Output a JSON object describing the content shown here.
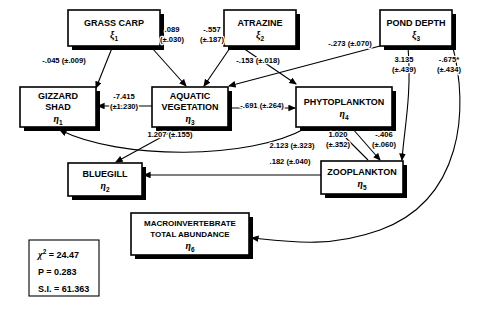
{
  "figure": {
    "type": "path-diagram",
    "background_color": "#ffffff",
    "line_color": "#000000"
  },
  "nodes": [
    {
      "id": "grass-carp",
      "lines": [
        "GRASS CARP"
      ],
      "symbol": "ξ",
      "subscript": "1",
      "x": 68,
      "y": 10,
      "w": 92,
      "h": 36
    },
    {
      "id": "atrazine",
      "lines": [
        "ATRAZINE"
      ],
      "symbol": "ξ",
      "subscript": "2",
      "x": 224,
      "y": 10,
      "w": 72,
      "h": 36
    },
    {
      "id": "pond-depth",
      "lines": [
        "POND DEPTH"
      ],
      "symbol": "ξ",
      "subscript": "3",
      "x": 380,
      "y": 10,
      "w": 72,
      "h": 36
    },
    {
      "id": "gizzard-shad",
      "lines": [
        "GIZZARD",
        "SHAD"
      ],
      "symbol": "η",
      "subscript": "1",
      "x": 20,
      "y": 87,
      "w": 76,
      "h": 40
    },
    {
      "id": "aquatic-vegetation",
      "lines": [
        "AQUATIC",
        "VEGETATION"
      ],
      "symbol": "η",
      "subscript": "3",
      "x": 152,
      "y": 87,
      "w": 76,
      "h": 40
    },
    {
      "id": "phytoplankton",
      "lines": [
        "PHYTOPLANKTON"
      ],
      "symbol": "η",
      "subscript": "4",
      "x": 296,
      "y": 87,
      "w": 96,
      "h": 40
    },
    {
      "id": "bluegill",
      "lines": [
        "BLUEGILL"
      ],
      "symbol": "η",
      "subscript": "2",
      "x": 68,
      "y": 163,
      "w": 74,
      "h": 33
    },
    {
      "id": "zooplankton",
      "lines": [
        "ZOOPLANKTON"
      ],
      "symbol": "η",
      "subscript": "5",
      "x": 321,
      "y": 161,
      "w": 82,
      "h": 33
    },
    {
      "id": "macroinvertebrate",
      "lines": [
        "MACROINVERTEBRATE",
        "TOTAL ABUNDANCE"
      ],
      "symbol": "η",
      "subscript": "6",
      "x": 131,
      "y": 213,
      "w": 118,
      "h": 42
    }
  ],
  "paths": [
    {
      "id": "grass-carp-to-gizzard-shad",
      "from": "grass-carp",
      "to": "gizzard-shad",
      "coefficient": "-.045",
      "error": "(±.009)",
      "label": "-.045 (±.009)",
      "label_x": 64,
      "label_y": 63,
      "d": "M 112 48 L 96 88"
    },
    {
      "id": "grass-carp-to-aquatic-vegetation",
      "from": "grass-carp",
      "to": "aquatic-vegetation",
      "coefficient": ".089",
      "error": "(±.030)",
      "label": ".089 (±.030)",
      "label_x": 172,
      "label_y": 32,
      "label_line1": ".089",
      "label_line2": "(±.030)",
      "d": "M 152 48 L 186 86"
    },
    {
      "id": "atrazine-to-aquatic-vegetation",
      "from": "atrazine",
      "to": "aquatic-vegetation",
      "coefficient": "-.557",
      "error": "(±.187)",
      "label": "-.557 (±.187)",
      "label_x": 212,
      "label_y": 32,
      "label_line1": "-.557",
      "label_line2": "(±.187)",
      "d": "M 230 48 L 204 86"
    },
    {
      "id": "atrazine-to-phytoplankton",
      "from": "atrazine",
      "to": "phytoplankton",
      "coefficient": "-.153",
      "error": "(±.018)",
      "label": "-.153 (±.018)",
      "label_x": 258,
      "label_y": 63,
      "d": "M 243 48 L 296 84"
    },
    {
      "id": "pond-depth-to-aquatic-vegetation",
      "from": "pond-depth",
      "to": "aquatic-vegetation",
      "coefficient": "-.273",
      "error": "(±.070)",
      "label": "-.273 (±.070)",
      "label_x": 350,
      "label_y": 46,
      "d": "M 380 46 L 229 86"
    },
    {
      "id": "pond-depth-to-zooplankton",
      "from": "pond-depth",
      "to": "zooplankton",
      "coefficient": "3.135",
      "error": "(±.439)",
      "label": "3.135 (±.439)",
      "label_x": 404,
      "label_y": 62,
      "label_line1": "3.135",
      "label_line2": "(±.439)",
      "d": "M 408 47 C 412 95 404 130 402 160"
    },
    {
      "id": "pond-depth-to-macroinvertebrate",
      "from": "pond-depth",
      "to": "macroinvertebrate",
      "coefficient": "-.675*",
      "error": "(±.434)",
      "label": "-.675* (±.434)",
      "label_x": 449,
      "label_y": 62,
      "label_line1": "-.675*",
      "label_line2": "(±.434)",
      "d": "M 452 44 C 470 110 462 200 380 230 C 330 248 290 242 252 238"
    },
    {
      "id": "aquatic-vegetation-to-gizzard-shad",
      "from": "aquatic-vegetation",
      "to": "gizzard-shad",
      "coefficient": "-7.415",
      "error": "(±1.230)",
      "label": "-7.415 (±1.230)",
      "label_x": 124,
      "label_y": 99,
      "label_line1": "-7.415",
      "label_line2": "(±1.230)",
      "d": "M 152 106 L 98 106"
    },
    {
      "id": "aquatic-vegetation-to-phytoplankton",
      "from": "aquatic-vegetation",
      "to": "phytoplankton",
      "coefficient": "-.691",
      "error": "(±.264)",
      "label": "-.691 (±.264)",
      "label_x": 262,
      "label_y": 108,
      "d": "M 228 108 L 295 108"
    },
    {
      "id": "aquatic-vegetation-to-bluegill",
      "from": "aquatic-vegetation",
      "to": "bluegill",
      "coefficient": "1.207",
      "error": "(±.155)",
      "label": "1.207 (±.155)",
      "label_x": 170,
      "label_y": 137,
      "d": "M 178 128 L 116 162"
    },
    {
      "id": "phytoplankton-to-gizzard-shad",
      "from": "phytoplankton",
      "to": "gizzard-shad",
      "coefficient": "2.123",
      "error": "(±.323)",
      "label": "2.123 (±.323)",
      "label_x": 292,
      "label_y": 148,
      "d": "M 306 128 C 250 160 120 160 60 130"
    },
    {
      "id": "zooplankton-to-phytoplankton",
      "from": "zooplankton",
      "to": "phytoplankton",
      "coefficient": "1.020",
      "error": "(±.352)",
      "label": "1.020 (±.352)",
      "label_x": 338,
      "label_y": 137,
      "label_line1": "1.020",
      "label_line2": "(±.352)",
      "d": "M 368 160 L 336 128"
    },
    {
      "id": "phytoplankton-to-zooplankton",
      "from": "phytoplankton",
      "to": "zooplankton",
      "coefficient": "-.406",
      "error": "(±.060)",
      "label": "-.406 (±.060)",
      "label_x": 384,
      "label_y": 137,
      "label_line1": "-.406",
      "label_line2": "(±.060)",
      "d": "M 352 128 L 380 160"
    },
    {
      "id": "zooplankton-to-bluegill",
      "from": "zooplankton",
      "to": "bluegill",
      "coefficient": ".182",
      "error": "(±.040)",
      "label": ".182 (±.040)",
      "label_x": 290,
      "label_y": 164,
      "d": "M 321 175 L 144 175"
    }
  ],
  "stats_box": {
    "id": "fit-statistics",
    "x": 29,
    "y": 240,
    "w": 70,
    "h": 56,
    "rows": [
      {
        "id": "chi-square",
        "symbol": "χ",
        "superscript": "2",
        "text": " = 24.47",
        "full": "χ² = 24.47"
      },
      {
        "id": "p-value",
        "symbol": "",
        "superscript": "",
        "text": "P = 0.283",
        "full": "P = 0.283"
      },
      {
        "id": "stability-index",
        "symbol": "",
        "superscript": "",
        "text": "S.I. = 61.363",
        "full": "S.I. = 61.363"
      }
    ]
  }
}
